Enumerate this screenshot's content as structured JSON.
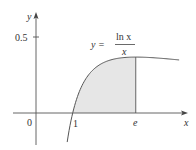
{
  "chart_data": {
    "type": "area",
    "title": "",
    "function_label": {
      "lhs": "y =",
      "numerator": "ln x",
      "denominator": "x"
    },
    "xlabel": "x",
    "ylabel": "y",
    "x_ticks": [
      {
        "value": 0,
        "label": "0"
      },
      {
        "value": 1,
        "label": "1"
      },
      {
        "value": 2.718,
        "label": "e"
      }
    ],
    "y_ticks": [
      {
        "value": 0.5,
        "label": "0.5"
      }
    ],
    "shaded_region": {
      "from": 1,
      "to": 2.718,
      "description": "area under y = ln x / x between x = 1 and x = e"
    },
    "curve": {
      "expression": "ln(x)/x",
      "x": [
        0.85,
        0.9,
        1.0,
        1.2,
        1.5,
        2.0,
        2.5,
        2.718,
        3.0,
        3.5,
        3.9
      ],
      "y": [
        -0.191,
        -0.117,
        0.0,
        0.152,
        0.27,
        0.347,
        0.367,
        0.368,
        0.366,
        0.358,
        0.349
      ]
    },
    "xlim": [
      -0.6,
      4.1
    ],
    "ylim": [
      -0.21,
      0.68
    ],
    "grid": false,
    "colors": {
      "curve": "#555555",
      "axis": "#555555",
      "shade": "#e6e6e6"
    }
  }
}
